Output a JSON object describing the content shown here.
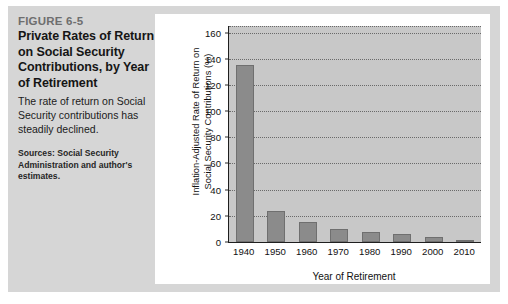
{
  "figure": {
    "number": "FIGURE 6-5",
    "title": "Private Rates of Return on Social Security Contributions, by Year of Retirement",
    "description": "The rate of return on Social Security contributions has steadily declined.",
    "sources": "Sources: Social Security Administration and author's estimates."
  },
  "colors": {
    "frame_background": "#d6d6d6",
    "panel_background": "#ffffff",
    "plot_background": "#c8c8c8",
    "bar_fill": "#8b8b8b",
    "axis": "#1f1f1f",
    "figure_number": "#6e6e6e"
  },
  "chart_data": {
    "type": "bar",
    "title": "",
    "categories": [
      "1940",
      "1950",
      "1960",
      "1970",
      "1980",
      "1990",
      "2000",
      "2010"
    ],
    "values": [
      135,
      24,
      15,
      10,
      8,
      6,
      4,
      1.5
    ],
    "xlabel": "Year of Retirement",
    "ylabel_line1": "Inflation-Adjusted Rate of Return on",
    "ylabel_line2": "Social Security Contributions (%)",
    "ylim": [
      0,
      165
    ],
    "yticks": [
      0,
      20,
      40,
      60,
      80,
      100,
      120,
      140,
      160
    ],
    "ytick_labels": [
      "0",
      "20",
      "40",
      "60",
      "80",
      "100",
      "120",
      "140",
      "160"
    ],
    "grid": true,
    "legend": "none"
  }
}
